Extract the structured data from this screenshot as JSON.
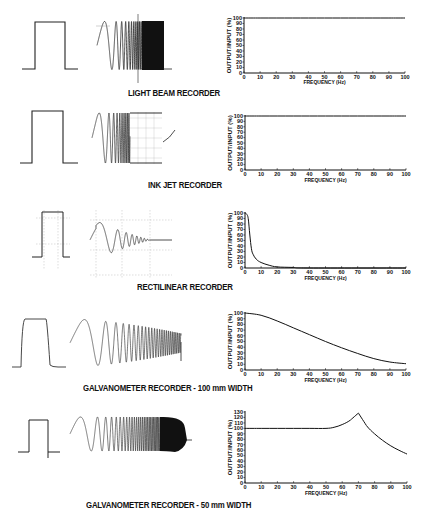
{
  "figure": {
    "y_axis_label": "OUTPUT/INPUT (%)",
    "x_axis_label": "FREQUENCY (Hz)",
    "panels": [
      {
        "title": "LIGHT BEAM RECORDER"
      },
      {
        "title": "INK JET RECORDER"
      },
      {
        "title": "RECTILINEAR RECORDER"
      },
      {
        "title": "GALVANOMETER RECORDER - 100 mm WIDTH"
      },
      {
        "title": "GALVANOMETER RECORDER - 50 mm WIDTH"
      }
    ]
  },
  "chart_data": [
    {
      "type": "line",
      "title": "LIGHT BEAM RECORDER",
      "xlabel": "FREQUENCY (Hz)",
      "ylabel": "OUTPUT/INPUT (%)",
      "xlim": [
        0,
        100
      ],
      "ylim": [
        0,
        100
      ],
      "x_ticks": [
        0,
        10,
        20,
        30,
        40,
        50,
        60,
        70,
        80,
        90,
        100
      ],
      "y_ticks": [
        0,
        10,
        20,
        30,
        40,
        50,
        60,
        70,
        80,
        90,
        100
      ],
      "x": [
        0,
        10,
        20,
        30,
        40,
        50,
        60,
        70,
        80,
        90,
        100
      ],
      "values": [
        100,
        100,
        100,
        100,
        100,
        100,
        100,
        100,
        100,
        100,
        100
      ]
    },
    {
      "type": "line",
      "title": "INK JET RECORDER",
      "xlabel": "FREQUENCY (Hz)",
      "ylabel": "OUTPUT/INPUT (%)",
      "xlim": [
        0,
        100
      ],
      "ylim": [
        0,
        100
      ],
      "x_ticks": [
        0,
        10,
        20,
        30,
        40,
        50,
        60,
        70,
        80,
        90,
        100
      ],
      "y_ticks": [
        0,
        10,
        20,
        30,
        40,
        50,
        60,
        70,
        80,
        90,
        100
      ],
      "x": [
        0,
        10,
        20,
        30,
        40,
        50,
        60,
        70,
        80,
        90,
        100
      ],
      "values": [
        100,
        100,
        100,
        100,
        100,
        100,
        100,
        100,
        100,
        100,
        100
      ]
    },
    {
      "type": "line",
      "title": "RECTILINEAR RECORDER",
      "xlabel": "FREQUENCY (Hz)",
      "ylabel": "OUTPUT/INPUT (%)",
      "xlim": [
        0,
        100
      ],
      "ylim": [
        0,
        100
      ],
      "x_ticks": [
        0,
        10,
        20,
        30,
        40,
        50,
        60,
        70,
        80,
        90,
        100
      ],
      "y_ticks": [
        0,
        10,
        20,
        30,
        40,
        50,
        60,
        70,
        80,
        90,
        100
      ],
      "x": [
        0,
        1,
        2,
        3,
        4,
        5,
        7,
        10,
        15,
        20,
        30,
        40,
        100
      ],
      "values": [
        100,
        98,
        90,
        60,
        35,
        25,
        16,
        10,
        5,
        2,
        1,
        0,
        0
      ]
    },
    {
      "type": "line",
      "title": "GALVANOMETER RECORDER - 100 mm WIDTH",
      "xlabel": "FREQUENCY (Hz)",
      "ylabel": "OUTPUT/INPUT (%)",
      "xlim": [
        0,
        100
      ],
      "ylim": [
        0,
        100
      ],
      "x_ticks": [
        0,
        10,
        20,
        30,
        40,
        50,
        60,
        70,
        80,
        90,
        100
      ],
      "y_ticks": [
        0,
        10,
        20,
        30,
        40,
        50,
        60,
        70,
        80,
        90,
        100
      ],
      "x": [
        0,
        10,
        20,
        30,
        40,
        50,
        60,
        70,
        80,
        90,
        100
      ],
      "values": [
        100,
        96,
        86,
        74,
        62,
        50,
        39,
        29,
        20,
        14,
        11
      ]
    },
    {
      "type": "line",
      "title": "GALVANOMETER RECORDER - 50 mm WIDTH",
      "xlabel": "FREQUENCY (Hz)",
      "ylabel": "OUTPUT/INPUT (%)",
      "xlim": [
        0,
        100
      ],
      "ylim": [
        0,
        130
      ],
      "x_ticks": [
        0,
        10,
        20,
        30,
        40,
        50,
        60,
        70,
        80,
        90,
        100
      ],
      "y_ticks": [
        0,
        10,
        20,
        30,
        40,
        50,
        60,
        70,
        80,
        90,
        100,
        110,
        120,
        130
      ],
      "x": [
        0,
        10,
        20,
        30,
        40,
        50,
        55,
        60,
        65,
        70,
        75,
        80,
        85,
        90,
        95,
        100
      ],
      "values": [
        100,
        100,
        100,
        100,
        100,
        100,
        102,
        107,
        115,
        128,
        105,
        90,
        78,
        68,
        60,
        53
      ]
    }
  ]
}
